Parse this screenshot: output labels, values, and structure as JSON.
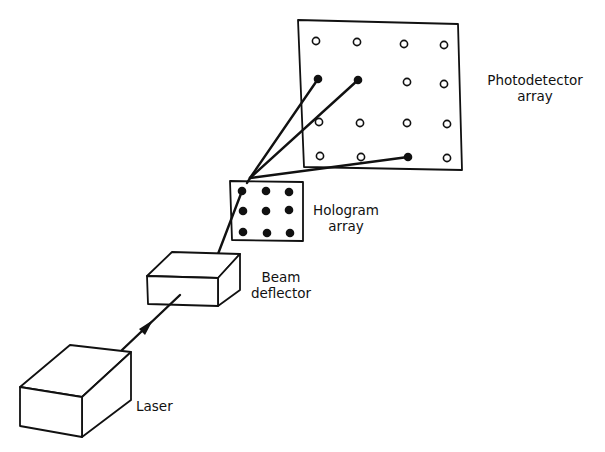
{
  "diagram": {
    "type": "optical-interconnect-schematic",
    "components": [
      {
        "id": "laser",
        "label": "Laser"
      },
      {
        "id": "beam_deflector",
        "label_line1": "Beam",
        "label_line2": "deflector"
      },
      {
        "id": "hologram_array",
        "label_line1": "Hologram",
        "label_line2": "array",
        "grid": "3x3",
        "dots": 9
      },
      {
        "id": "photodetector_array",
        "label_line1": "Photodetector",
        "label_line2": "array",
        "grid": "4x4",
        "detectors": 16,
        "illuminated": 3
      }
    ],
    "connections": [
      {
        "from": "laser",
        "to": "beam_deflector",
        "arrow": true
      },
      {
        "from": "beam_deflector",
        "to": "hologram_array"
      },
      {
        "from": "hologram_array",
        "to": "photodetector_array",
        "beams": 3
      }
    ]
  },
  "labels": {
    "laser": "Laser",
    "beam_deflector_1": "Beam",
    "beam_deflector_2": "deflector",
    "hologram_1": "Hologram",
    "hologram_2": "array",
    "photodetector_1": "Photodetector",
    "photodetector_2": "array"
  },
  "colors": {
    "ink": "#111111",
    "background": "#ffffff"
  }
}
